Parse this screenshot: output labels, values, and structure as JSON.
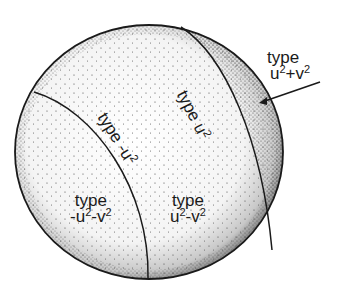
{
  "diagram": {
    "kind": "sphere-region-diagram",
    "colors": {
      "ink": "#1a1a1a",
      "background": "#ffffff"
    },
    "regions": [
      {
        "id": "plus-plus",
        "label_line1": "type",
        "label_line2_parts": [
          "u",
          "2",
          "+v",
          "2"
        ]
      },
      {
        "id": "u2-curve",
        "label_parts": [
          "type u",
          "2"
        ]
      },
      {
        "id": "neg-u2-curve",
        "label_parts": [
          "type -u",
          "2"
        ]
      },
      {
        "id": "minus-minus",
        "label_line1": "type",
        "label_line2_parts": [
          "-u",
          "2",
          "-v",
          "2"
        ]
      },
      {
        "id": "plus-minus",
        "label_line1": "type",
        "label_line2_parts": [
          "u",
          "2",
          "-v",
          "2"
        ]
      }
    ]
  }
}
